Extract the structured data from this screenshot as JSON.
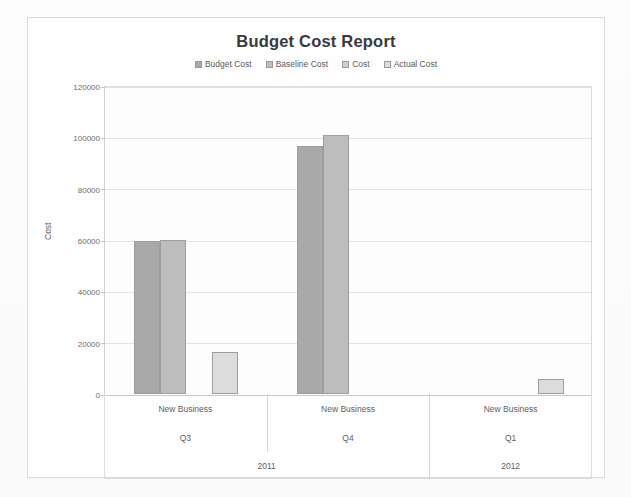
{
  "chart_data": {
    "type": "bar",
    "title": "Budget Cost Report",
    "xlabel": "",
    "ylabel": "Cost",
    "ylim": [
      0,
      120000
    ],
    "yticks": [
      0,
      20000,
      40000,
      60000,
      80000,
      100000,
      120000
    ],
    "ytick_labels": [
      "0",
      "20000",
      "40000",
      "60000",
      "80000",
      "100000",
      "120000"
    ],
    "grid": true,
    "legend_position": "top-center",
    "categories": [
      "Q3",
      "Q4",
      "Q1"
    ],
    "category_groups": [
      {
        "name": "New Business",
        "quarter": "Q3",
        "year": "2011"
      },
      {
        "name": "New Business",
        "quarter": "Q4",
        "year": "2011"
      },
      {
        "name": "New Business",
        "quarter": "Q1",
        "year": "2012"
      }
    ],
    "series": [
      {
        "name": "Budget Cost",
        "color": "#a9a9a9",
        "values": [
          59500,
          96500,
          null
        ]
      },
      {
        "name": "Baseline Cost",
        "color": "#bdbdbd",
        "values": [
          60200,
          101000,
          null
        ]
      },
      {
        "name": "Cost",
        "color": "#d0d0d0",
        "values": [
          null,
          null,
          null
        ]
      },
      {
        "name": "Actual Cost",
        "color": "#dcdcdc",
        "values": [
          16500,
          null,
          5700
        ]
      }
    ]
  },
  "legend": {
    "items": [
      {
        "label": "Budget Cost"
      },
      {
        "label": "Baseline Cost"
      },
      {
        "label": "Cost"
      },
      {
        "label": "Actual Cost"
      }
    ]
  },
  "colors": {
    "frame": "#d9d9d9",
    "grid": "#e2e2e2",
    "axis": "#c9c9c9",
    "text": "#5e5e5e",
    "title": "#3a3a3a"
  }
}
